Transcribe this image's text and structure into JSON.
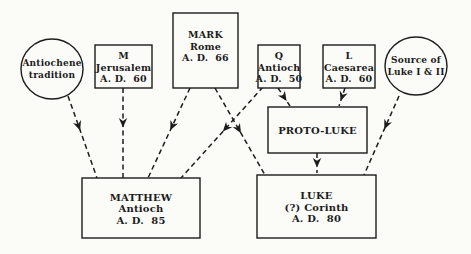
{
  "page": {
    "background": "#fbfbf8",
    "ink": "#1c1c1c",
    "width": 471,
    "height": 254
  },
  "diagram": {
    "dash_pattern": "5 3.5",
    "line_width": 1.5,
    "box_border_width": 1.4,
    "nodes": [
      {
        "id": "antiochene-tradition",
        "shape": "ellipse",
        "cx": 52,
        "cy": 69,
        "rx": 31,
        "ry": 30,
        "lines": [
          "Antiochene",
          "tradition"
        ],
        "font_size": 9
      },
      {
        "id": "m-jerusalem",
        "shape": "rect",
        "x": 95,
        "y": 45,
        "w": 57,
        "h": 43,
        "lines": [
          "M",
          "Jerusalem",
          "A. D.  60"
        ],
        "font_size": 9.5
      },
      {
        "id": "mark-rome",
        "shape": "rect",
        "x": 173,
        "y": 13,
        "w": 65,
        "h": 75,
        "lines": [
          "MARK",
          "Rome",
          "A. D.  66"
        ],
        "font_size": 9.5,
        "text_offset_y": -5
      },
      {
        "id": "q-antioch",
        "shape": "rect",
        "x": 258,
        "y": 45,
        "w": 42,
        "h": 43,
        "lines": [
          "Q",
          "Antioch",
          "A. D.  50"
        ],
        "font_size": 9.5
      },
      {
        "id": "l-caesarea",
        "shape": "rect",
        "x": 323,
        "y": 45,
        "w": 52,
        "h": 43,
        "lines": [
          "L",
          "Caesarea",
          "A. D.  60"
        ],
        "font_size": 9.5
      },
      {
        "id": "source-of-luke-i-ii",
        "shape": "ellipse",
        "cx": 416,
        "cy": 66,
        "rx": 31,
        "ry": 29,
        "lines": [
          "Source of",
          "Luke I & II"
        ],
        "font_size": 9
      },
      {
        "id": "proto-luke",
        "shape": "rect",
        "x": 268,
        "y": 107,
        "w": 99,
        "h": 46,
        "lines": [
          "PROTO-LUKE"
        ],
        "font_size": 10
      },
      {
        "id": "matthew",
        "shape": "rect",
        "x": 82,
        "y": 178,
        "w": 118,
        "h": 60,
        "lines": [
          "MATTHEW",
          "Antioch",
          "A. D.  85"
        ],
        "font_size": 10
      },
      {
        "id": "luke",
        "shape": "rect",
        "x": 257,
        "y": 175,
        "w": 119,
        "h": 63,
        "lines": [
          "LUKE",
          "(?) Corinth",
          "A. D.  80"
        ],
        "font_size": 10
      }
    ],
    "edges": [
      {
        "from": "antiochene-tradition",
        "to": "matthew",
        "x1": 68,
        "y1": 96,
        "x2": 97,
        "y2": 178,
        "head_t": 0.42
      },
      {
        "from": "m-jerusalem",
        "to": "matthew",
        "x1": 123,
        "y1": 88,
        "x2": 123,
        "y2": 178,
        "head_t": 0.44
      },
      {
        "from": "mark-rome",
        "to": "matthew",
        "x1": 190,
        "y1": 88,
        "x2": 148,
        "y2": 178,
        "head_t": 0.47
      },
      {
        "from": "mark-rome",
        "to": "luke",
        "x1": 215,
        "y1": 88,
        "x2": 265,
        "y2": 175,
        "head_t": 0.52
      },
      {
        "from": "q-antioch",
        "to": "matthew",
        "x1": 263,
        "y1": 87,
        "x2": 181,
        "y2": 178,
        "head_t": 0.49
      },
      {
        "from": "q-antioch",
        "to": "proto-luke",
        "x1": 278,
        "y1": 88,
        "x2": 290,
        "y2": 106,
        "head_t": 0.72
      },
      {
        "from": "l-caesarea",
        "to": "proto-luke",
        "x1": 345,
        "y1": 88,
        "x2": 339,
        "y2": 106,
        "head_t": 0.72
      },
      {
        "from": "proto-luke",
        "to": "luke",
        "x1": 317,
        "y1": 153,
        "x2": 317,
        "y2": 173,
        "head_t": 0.72
      },
      {
        "from": "source-of-luke-i-ii",
        "to": "luke",
        "x1": 399,
        "y1": 96,
        "x2": 364,
        "y2": 175,
        "head_t": 0.42
      }
    ]
  }
}
